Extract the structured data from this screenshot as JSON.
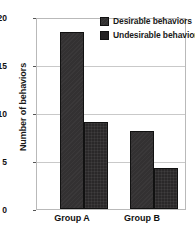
{
  "chart_data": {
    "type": "bar",
    "title": "",
    "xlabel": "",
    "ylabel": "Number of behaviors",
    "categories": [
      "Group A",
      "Group B"
    ],
    "series": [
      {
        "name": "Desirable behaviors",
        "values": [
          18.5,
          8.2
        ],
        "color": "#333132"
      },
      {
        "name": "Undesirable behaviors",
        "values": [
          9.1,
          4.3
        ],
        "color": "#232122"
      }
    ],
    "ylim": [
      0,
      20
    ],
    "yticks": [
      0,
      5,
      10,
      15,
      20
    ],
    "ytick_labels": [
      "0",
      "5",
      "10",
      "15",
      "20"
    ],
    "grid": true,
    "grid_axis": "y",
    "legend_position": "top-right-inside"
  },
  "legend": {
    "items": [
      {
        "label": "Desirable behaviors",
        "swatch": "desirable-swatch"
      },
      {
        "label": "Undesirable behaviors",
        "swatch": "undesirable-swatch"
      }
    ]
  },
  "axes": {
    "y_title": "Number of behaviors",
    "y_ticks": [
      "20",
      "15",
      "10",
      "5",
      "0"
    ],
    "x_ticks": [
      "Group A",
      "Group B"
    ]
  }
}
